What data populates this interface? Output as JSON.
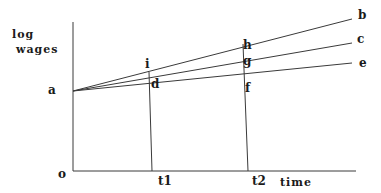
{
  "diagram": {
    "y_axis_label_line1": "log",
    "y_axis_label_line2": "wages",
    "x_axis_label": "time",
    "origin_label": "o",
    "start_label": "a",
    "time_ticks": [
      "t1",
      "t2"
    ],
    "line_end_labels": {
      "top": "b",
      "middle": "c",
      "bottom": "e"
    },
    "t1_point_labels": {
      "top": "i",
      "bottom": "d"
    },
    "t2_point_labels": {
      "top": "h",
      "middle": "g",
      "bottom": "f"
    }
  }
}
